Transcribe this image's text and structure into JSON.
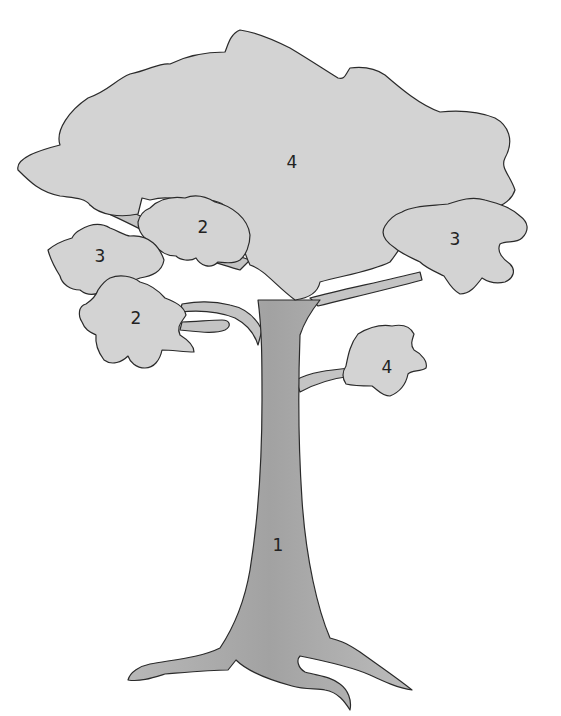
{
  "diagram": {
    "type": "numbered tree illustration",
    "colors": {
      "background": "#ffffff",
      "foliage": "#d3d3d3",
      "trunk": "#a8a8a8",
      "outline": "#2a2a2a"
    },
    "labels": {
      "trunk": "1",
      "canopy_main": "4",
      "cluster_upper_left": "2",
      "cluster_left": "3",
      "cluster_lower_left": "2",
      "cluster_right": "3",
      "cluster_small_right": "4"
    }
  }
}
